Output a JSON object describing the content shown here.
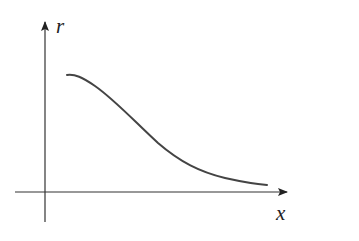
{
  "diagram": {
    "type": "function-sketch",
    "axes": {
      "x_label": "x",
      "y_label": "r"
    },
    "colors": {
      "axis": "#333333",
      "curve": "#444444",
      "background": "#ffffff"
    },
    "curve_path": "M 67 75 C 75 74, 82 77, 95 86 C 115 100, 135 122, 158 143 C 180 162, 200 172, 225 178 C 243 182, 255 184, 267 185"
  }
}
